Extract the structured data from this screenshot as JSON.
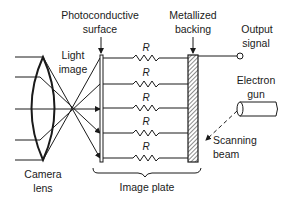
{
  "diagram": {
    "labels": {
      "photoconductive_line1": "Photoconductive",
      "photoconductive_line2": "surface",
      "metallized_line1": "Metallized",
      "metallized_line2": "backing",
      "output_line1": "Output",
      "output_line2": "signal",
      "light_line1": "Light",
      "light_line2": "image",
      "electron_line1": "Electron",
      "electron_line2": "gun",
      "scanning_line1": "Scanning",
      "scanning_line2": "beam",
      "camera_line1": "Camera",
      "camera_line2": "lens",
      "image_plate": "Image plate"
    },
    "resistors": [
      {
        "label": "R"
      },
      {
        "label": "R"
      },
      {
        "label": "R"
      },
      {
        "label": "R"
      },
      {
        "label": "R"
      }
    ]
  }
}
